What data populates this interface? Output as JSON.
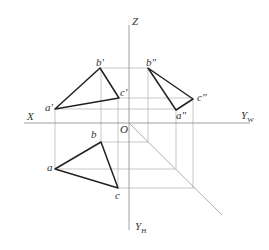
{
  "diagram": {
    "type": "three-view orthographic projection of triangle ABC",
    "axes": {
      "x_label": "X",
      "z_label": "Z",
      "yw_label": "Y",
      "yw_sub": "W",
      "yh_label": "Y",
      "yh_sub": "H",
      "origin_label": "O"
    },
    "points": {
      "front": {
        "a": "a'",
        "b": "b'",
        "c": "c'"
      },
      "side": {
        "a": "a\"",
        "b": "b\"",
        "c": "c\""
      },
      "top": {
        "a": "a",
        "b": "b",
        "c": "c"
      }
    },
    "colors": {
      "triangle": "#222222",
      "construction": "#aaaaaa",
      "axis": "#888888"
    }
  }
}
